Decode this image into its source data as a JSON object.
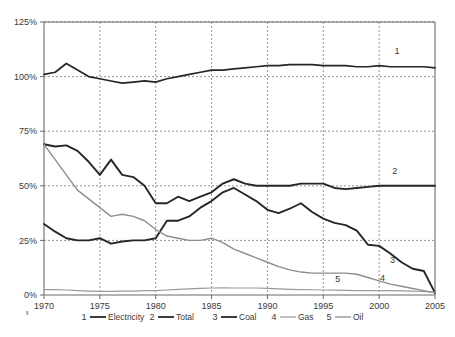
{
  "chart_data": {
    "type": "line",
    "title": "",
    "subtitle": "",
    "xlabel": "",
    "ylabel": "",
    "xlim": [
      1970,
      2005
    ],
    "ylim": [
      0,
      125
    ],
    "xticks": [
      "1970",
      "1975",
      "1980",
      "1985",
      "1990",
      "1995",
      "2000",
      "2005"
    ],
    "xtick_values": [
      1970,
      1975,
      1980,
      1985,
      1990,
      1995,
      2000,
      2005
    ],
    "yticks": [
      "0%",
      "25%",
      "50%",
      "75%",
      "100%",
      "125%"
    ],
    "ytick_values": [
      0,
      25,
      50,
      75,
      100,
      125
    ],
    "grid": "dashed-both",
    "legend_position": "bottom",
    "x": [
      1970,
      1971,
      1972,
      1973,
      1974,
      1975,
      1976,
      1977,
      1978,
      1979,
      1980,
      1981,
      1982,
      1983,
      1984,
      1985,
      1986,
      1987,
      1988,
      1989,
      1990,
      1991,
      1992,
      1993,
      1994,
      1995,
      1996,
      1997,
      1998,
      1999,
      2000,
      2001,
      2002,
      2003,
      2004,
      2005
    ],
    "series": [
      {
        "name": "Electricity",
        "tag": "1",
        "color": "#262626",
        "width": 1.7,
        "tag_x": 2001.6,
        "tag_y": 110.5,
        "values": [
          101,
          102,
          106,
          103,
          100,
          99,
          98,
          97,
          97.5,
          98,
          97.5,
          99,
          100,
          101,
          102,
          103,
          103,
          103.5,
          104,
          104.5,
          105,
          105,
          105.5,
          105.5,
          105.5,
          105,
          105,
          105,
          104.5,
          104.5,
          105,
          104.5,
          104.5,
          104.5,
          104.5,
          104
        ]
      },
      {
        "name": "Total",
        "tag": "2",
        "color": "#262626",
        "width": 1.9,
        "tag_x": 2001.4,
        "tag_y": 55.5,
        "values": [
          69,
          68,
          68.5,
          66,
          61,
          55,
          62,
          55,
          54,
          50,
          42,
          42,
          45,
          43,
          45,
          47,
          51,
          53,
          51,
          50,
          50,
          50,
          50,
          51,
          51,
          51,
          49,
          48.5,
          49,
          49.5,
          50,
          50,
          50,
          50,
          50,
          50
        ]
      },
      {
        "name": "Coal",
        "tag": "3",
        "color": "#262626",
        "width": 1.9,
        "tag_x": 2001.2,
        "tag_y": 14.5,
        "values": [
          32.5,
          29,
          26,
          25,
          25,
          26,
          23.5,
          24.5,
          25,
          25,
          26,
          34,
          34,
          36,
          40,
          43,
          47,
          49,
          46,
          43,
          39,
          37.5,
          39.5,
          42,
          38,
          35,
          33,
          32,
          29.5,
          23,
          22.5,
          19,
          15,
          12,
          11,
          1
        ]
      },
      {
        "name": "Gas",
        "tag": "4",
        "color": "#9a9a9a",
        "width": 1.2,
        "tag_x": 2000.3,
        "tag_y": 6.5,
        "values": [
          2.5,
          2.5,
          2.3,
          2,
          1.8,
          1.7,
          1.7,
          1.8,
          1.8,
          2,
          2,
          2.3,
          2.6,
          2.8,
          3,
          3.2,
          3.3,
          3.2,
          3.2,
          3.2,
          3,
          2.8,
          2.6,
          2.5,
          2.4,
          2.3,
          2.2,
          2.1,
          2,
          2,
          2,
          2,
          1.9,
          1.8,
          1.6,
          1.2
        ]
      },
      {
        "name": "Oil",
        "tag": "5",
        "color": "#8e8e8e",
        "width": 1.4,
        "tag_x": 1996.3,
        "tag_y": 5.8,
        "values": [
          69,
          62,
          55,
          48,
          44,
          40,
          36,
          37,
          36,
          34,
          30,
          27,
          26,
          25,
          25,
          26,
          24,
          21,
          19,
          17,
          15,
          13,
          11.5,
          10.5,
          10,
          10,
          10,
          10,
          9.5,
          8,
          6.5,
          5,
          4,
          3,
          2,
          1
        ]
      }
    ],
    "legend": [
      {
        "num": "1",
        "label": "Electricity",
        "color": "#262626",
        "width": 1.8
      },
      {
        "num": "2",
        "label": "Total",
        "color": "#262626",
        "width": 1.8
      },
      {
        "num": "3",
        "label": "Coal",
        "color": "#262626",
        "width": 1.8
      },
      {
        "num": "4",
        "label": "Gas",
        "color": "#9a9a9a",
        "width": 1.2
      },
      {
        "num": "5",
        "label": "Oil",
        "color": "#8e8e8e",
        "width": 1.3
      }
    ]
  }
}
